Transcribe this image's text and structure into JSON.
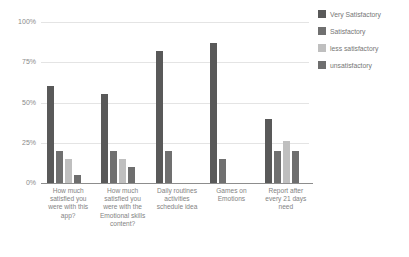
{
  "chart_data": {
    "type": "bar",
    "title": "",
    "subtitle": "",
    "xlabel": "",
    "ylabel": "",
    "ylim": [
      0,
      100
    ],
    "ytick_labels": [
      "100%",
      "75%",
      "50%",
      "25%",
      "0%"
    ],
    "ytick_values": [
      100,
      75,
      50,
      25,
      0
    ],
    "grid": true,
    "legend_position": "right",
    "categories": [
      "How much satisfied  you were with this app?",
      "How much satisfied you were with the Emotional skills content?",
      "Daily routines activities schedule idea",
      "Games on Emotions",
      "Report after every 21 days need"
    ],
    "series": [
      {
        "name": "Very Satisfactory",
        "color": "#595959",
        "values": [
          60,
          55,
          82,
          87,
          40
        ]
      },
      {
        "name": "Satisfactory",
        "color": "#707070",
        "values": [
          20,
          20,
          20,
          15,
          20
        ]
      },
      {
        "name": "less satisfactory",
        "color": "#bfbfbf",
        "values": [
          15,
          15,
          null,
          null,
          26
        ]
      },
      {
        "name": "unsatisfactory",
        "color": "#6e6e6e",
        "values": [
          5,
          10,
          null,
          null,
          20
        ]
      }
    ]
  },
  "legend": {
    "items": [
      {
        "label": "Very Satisfactory",
        "color": "#595959"
      },
      {
        "label": "Satisfactory",
        "color": "#707070"
      },
      {
        "label": "less satisfactory",
        "color": "#bfbfbf"
      },
      {
        "label": "unsatisfactory",
        "color": "#6e6e6e"
      }
    ]
  },
  "axes": {
    "y": {
      "ticks": [
        {
          "label": "100%",
          "value": 100
        },
        {
          "label": "75%",
          "value": 75
        },
        {
          "label": "50%",
          "value": 50
        },
        {
          "label": "25%",
          "value": 25
        },
        {
          "label": "0%",
          "value": 0
        }
      ]
    },
    "x": {
      "ticks": [
        {
          "label": "How much satisfied  you were with this app?"
        },
        {
          "label": "How much satisfied you were with the Emotional skills content?"
        },
        {
          "label": "Daily routines activities schedule idea"
        },
        {
          "label": "Games on Emotions"
        },
        {
          "label": "Report after every 21 days need"
        }
      ]
    }
  }
}
